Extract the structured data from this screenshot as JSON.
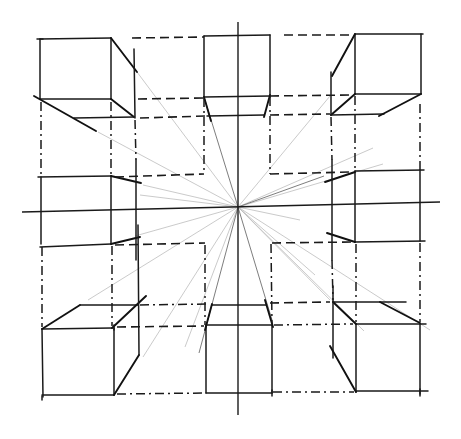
{
  "diagram": {
    "type": "one-point perspective sketch",
    "colors": {
      "background": "#ffffff",
      "ink": "#1a1a1a",
      "construction_rays": "#bdbdbd"
    },
    "vanishing_point": {
      "x": 238,
      "y": 207
    },
    "horizon_line": {
      "x1": 22,
      "y1": 212,
      "x2": 440,
      "y2": 202
    },
    "vertical_axis": {
      "x": 238,
      "y1": 22,
      "y2": 415
    },
    "boxes": [
      {
        "id": "top-left",
        "position": "above-left of horizon"
      },
      {
        "id": "top-center",
        "position": "above horizon"
      },
      {
        "id": "top-right",
        "position": "above-right of horizon"
      },
      {
        "id": "middle-left",
        "position": "left on horizon"
      },
      {
        "id": "middle-right",
        "position": "right on horizon"
      },
      {
        "id": "bottom-left",
        "position": "below-left of horizon"
      },
      {
        "id": "bottom-center",
        "position": "below horizon"
      },
      {
        "id": "bottom-right",
        "position": "below-right of horizon"
      }
    ],
    "label": "Perspective box grid drawing"
  }
}
